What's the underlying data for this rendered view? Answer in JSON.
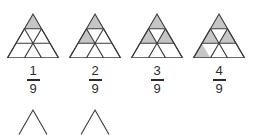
{
  "worksheet": {
    "title": "Fraction triangles — ninths",
    "shade_color": "#c6c6c6",
    "line_color": "#3a3a3a",
    "background": "#ffffff",
    "denominator_total": 9,
    "rows_per_triangle": 3
  },
  "figures": [
    {
      "id": "triangle-1",
      "shaded_count": 1,
      "numerator": "1",
      "bar": "",
      "denominator": "9",
      "fraction_text": "1/9",
      "shaded_cells": [
        "r1c1"
      ]
    },
    {
      "id": "triangle-2",
      "shaded_count": 2,
      "numerator": "2",
      "bar": "",
      "denominator": "9",
      "fraction_text": "2/9",
      "shaded_cells": [
        "r1c1",
        "r2c1"
      ]
    },
    {
      "id": "triangle-3",
      "shaded_count": 3,
      "numerator": "3",
      "bar": "",
      "denominator": "9",
      "fraction_text": "3/9",
      "shaded_cells": [
        "r1c1",
        "r2c1",
        "r2c3"
      ]
    },
    {
      "id": "triangle-4",
      "shaded_count": 4,
      "numerator": "4",
      "bar": "",
      "denominator": "9",
      "fraction_text": "4/9",
      "shaded_cells": [
        "r1c1",
        "r2c1",
        "r2c3",
        "r3c1"
      ]
    }
  ],
  "partial_row": {
    "note": "two triangle apexes cropped by the bottom edge",
    "items": [
      {
        "id": "partial-triangle-1",
        "visible": true
      },
      {
        "id": "partial-triangle-2",
        "visible": true
      },
      {
        "id": "partial-triangle-3",
        "visible": false
      },
      {
        "id": "partial-triangle-4",
        "visible": false
      }
    ]
  }
}
